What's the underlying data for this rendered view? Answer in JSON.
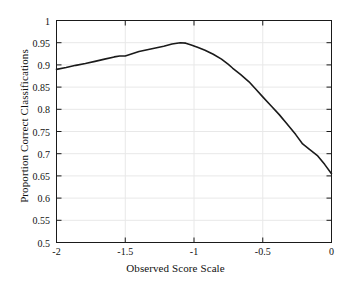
{
  "chart_data": {
    "type": "line",
    "title": "",
    "xlabel": "Observed Score Scale",
    "ylabel": "Proportion Correct Classifications",
    "xlim": [
      -2,
      0
    ],
    "ylim": [
      0.5,
      1
    ],
    "xticks": [
      "-2",
      "-1.5",
      "-1",
      "-0.5",
      "0"
    ],
    "xtick_values": [
      -2,
      -1.5,
      -1,
      -0.5,
      0
    ],
    "yticks": [
      "0.5",
      "0.55",
      "0.6",
      "0.65",
      "0.7",
      "0.75",
      "0.8",
      "0.85",
      "0.9",
      "0.95",
      "1"
    ],
    "ytick_values": [
      0.5,
      0.55,
      0.6,
      0.65,
      0.7,
      0.75,
      0.8,
      0.85,
      0.9,
      0.95,
      1
    ],
    "grid": true,
    "legend": null,
    "line_color": "#1a1a1a",
    "line_width": 1.6,
    "series": [
      {
        "name": "Proportion Correct Classifications",
        "x": [
          -2.0,
          -1.93,
          -1.86,
          -1.79,
          -1.72,
          -1.65,
          -1.58,
          -1.54,
          -1.5,
          -1.45,
          -1.4,
          -1.34,
          -1.28,
          -1.22,
          -1.16,
          -1.1,
          -1.06,
          -1.02,
          -0.97,
          -0.92,
          -0.86,
          -0.8,
          -0.75,
          -0.72,
          -0.66,
          -0.6,
          -0.55,
          -0.5,
          -0.44,
          -0.38,
          -0.32,
          -0.26,
          -0.21,
          -0.16,
          -0.1,
          -0.05,
          0.0
        ],
        "y": [
          0.89,
          0.894,
          0.899,
          0.903,
          0.908,
          0.913,
          0.918,
          0.92,
          0.92,
          0.925,
          0.93,
          0.934,
          0.938,
          0.942,
          0.947,
          0.95,
          0.949,
          0.945,
          0.939,
          0.933,
          0.924,
          0.913,
          0.901,
          0.893,
          0.878,
          0.862,
          0.845,
          0.828,
          0.808,
          0.788,
          0.766,
          0.743,
          0.722,
          0.71,
          0.695,
          0.676,
          0.655
        ]
      }
    ]
  },
  "figure": {
    "background_color": "#ffffff",
    "axes_color": "#1a1a1a",
    "grid_color": "#e8e8e8"
  }
}
